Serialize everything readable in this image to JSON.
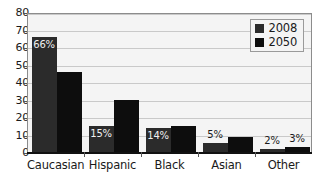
{
  "chart_data": {
    "type": "bar",
    "title": "",
    "subtitle": "",
    "xlabel": "",
    "ylabel": "",
    "ylim": [
      0,
      80
    ],
    "ytick_labels": [
      "80",
      "70",
      "60",
      "50",
      "40",
      "30",
      "20",
      "10",
      "0"
    ],
    "ytick_values": [
      80,
      70,
      60,
      50,
      40,
      30,
      20,
      10,
      0
    ],
    "grid": true,
    "legend_position": "top-right",
    "categories": [
      "Caucasian",
      "Hispanic",
      "Black",
      "Asian",
      "Other"
    ],
    "series": [
      {
        "name": "2008",
        "color": "#2b2b2b",
        "values": [
          66,
          15,
          14,
          5,
          2
        ],
        "labels": [
          "66%",
          "15%",
          "14%",
          "5%",
          "2%"
        ],
        "labels_visible": [
          true,
          true,
          true,
          true,
          true
        ]
      },
      {
        "name": "2050",
        "color": "#0d0d0d",
        "values": [
          46,
          30,
          15,
          8.5,
          3
        ],
        "labels": [
          "46%",
          "30%",
          "15%",
          "9%",
          "3%"
        ],
        "labels_visible": [
          false,
          false,
          false,
          false,
          true
        ]
      }
    ]
  },
  "legend": {
    "entries": [
      {
        "label": "2008",
        "color": "#2b2b2b"
      },
      {
        "label": "2050",
        "color": "#0d0d0d"
      }
    ]
  },
  "colors": {
    "series_2008": "#2b2b2b",
    "series_2050": "#0d0d0d",
    "plot_background": "#f4f4f4",
    "gridline": "#c9c9c9",
    "axis": "#111111",
    "text": "#1a1a1a"
  }
}
